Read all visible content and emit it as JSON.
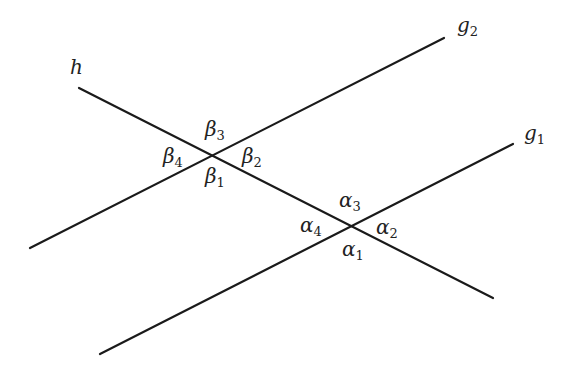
{
  "diagram": {
    "stroke_color": "#1a1a1a",
    "lines": [
      {
        "id": "h",
        "label": "h",
        "x1": 79,
        "y1": 88,
        "x2": 493,
        "y2": 298
      },
      {
        "id": "g2",
        "label": "g",
        "sub": "2",
        "x1": 30,
        "y1": 248,
        "x2": 444,
        "y2": 38
      },
      {
        "id": "g1",
        "label": "g",
        "sub": "1",
        "x1": 100,
        "y1": 354,
        "x2": 513,
        "y2": 144
      }
    ],
    "line_labels": {
      "h": {
        "main": "h",
        "sub": ""
      },
      "g2": {
        "main": "g",
        "sub": "2"
      },
      "g1": {
        "main": "g",
        "sub": "1"
      }
    },
    "angles": {
      "beta": {
        "vertex": [
          212,
          155
        ],
        "b1": {
          "main": "β",
          "sub": "1"
        },
        "b2": {
          "main": "β",
          "sub": "2"
        },
        "b3": {
          "main": "β",
          "sub": "3"
        },
        "b4": {
          "main": "β",
          "sub": "4"
        }
      },
      "alpha": {
        "vertex": [
          352,
          226
        ],
        "a1": {
          "main": "α",
          "sub": "1"
        },
        "a2": {
          "main": "α",
          "sub": "2"
        },
        "a3": {
          "main": "α",
          "sub": "3"
        },
        "a4": {
          "main": "α",
          "sub": "4"
        }
      }
    }
  }
}
